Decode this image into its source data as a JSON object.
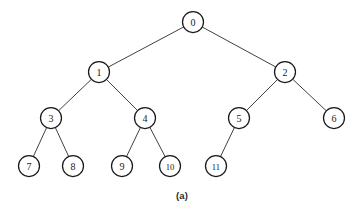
{
  "figure": {
    "caption": "(a)",
    "caption_x": 182,
    "caption_y": 190,
    "background_color": "#ffffff",
    "node_stroke_color": "#1a1a1a",
    "node_fill_color": "#ffffff",
    "edge_color": "#2b2b2b",
    "label_color": "#1a1a1a",
    "width": 364,
    "height": 216
  },
  "chart_data": {
    "type": "diagram",
    "diagram_type": "tree",
    "title": "(a)",
    "nodes": [
      {
        "id": "0",
        "label": "0",
        "x": 193,
        "y": 22,
        "r": 10.5,
        "level": 0
      },
      {
        "id": "1",
        "label": "1",
        "x": 99,
        "y": 72,
        "r": 10.5,
        "level": 1
      },
      {
        "id": "2",
        "label": "2",
        "x": 285,
        "y": 72,
        "r": 10.5,
        "level": 1
      },
      {
        "id": "3",
        "label": "3",
        "x": 51,
        "y": 118,
        "r": 10.5,
        "level": 2
      },
      {
        "id": "4",
        "label": "4",
        "x": 145,
        "y": 118,
        "r": 10.5,
        "level": 2
      },
      {
        "id": "5",
        "label": "5",
        "x": 239,
        "y": 118,
        "r": 10.5,
        "level": 2
      },
      {
        "id": "6",
        "label": "6",
        "x": 334,
        "y": 118,
        "r": 10.5,
        "level": 2
      },
      {
        "id": "7",
        "label": "7",
        "x": 29,
        "y": 166,
        "r": 10.5,
        "level": 3
      },
      {
        "id": "8",
        "label": "8",
        "x": 73,
        "y": 166,
        "r": 10.5,
        "level": 3
      },
      {
        "id": "9",
        "label": "9",
        "x": 122,
        "y": 166,
        "r": 10.5,
        "level": 3
      },
      {
        "id": "10",
        "label": "10",
        "x": 170,
        "y": 166,
        "r": 10.5,
        "level": 3
      },
      {
        "id": "11",
        "label": "11",
        "x": 216,
        "y": 166,
        "r": 10.5,
        "level": 3
      }
    ],
    "edges": [
      {
        "from": "0",
        "to": "1"
      },
      {
        "from": "0",
        "to": "2"
      },
      {
        "from": "1",
        "to": "3"
      },
      {
        "from": "1",
        "to": "4"
      },
      {
        "from": "2",
        "to": "5"
      },
      {
        "from": "2",
        "to": "6"
      },
      {
        "from": "3",
        "to": "7"
      },
      {
        "from": "3",
        "to": "8"
      },
      {
        "from": "4",
        "to": "9"
      },
      {
        "from": "4",
        "to": "10"
      },
      {
        "from": "5",
        "to": "11"
      }
    ]
  }
}
